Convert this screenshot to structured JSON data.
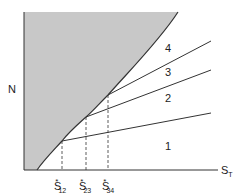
{
  "diagram": {
    "y_axis_label": "N",
    "x_axis_label": {
      "main": "S",
      "sub": "T"
    },
    "regions": [
      {
        "id": "1",
        "label": "1"
      },
      {
        "id": "2",
        "label": "2"
      },
      {
        "id": "3",
        "label": "3"
      },
      {
        "id": "4",
        "label": "4"
      }
    ],
    "critical_points": [
      {
        "main": "S",
        "star": "*",
        "sub": "12"
      },
      {
        "main": "S",
        "star": "*",
        "sub": "23"
      },
      {
        "main": "S",
        "star": "*",
        "sub": "34"
      }
    ],
    "colors": {
      "shaded_region": "#c8c8c8",
      "lines": "#333333",
      "background": "#ffffff"
    }
  }
}
